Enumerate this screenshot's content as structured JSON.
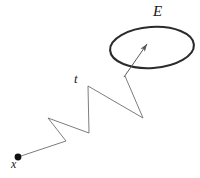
{
  "figure": {
    "background_color": "#ffffff",
    "width": 200,
    "height": 178,
    "labels": {
      "region": "E",
      "time": "t",
      "start_point": "x"
    },
    "colors": {
      "path_stroke": "#6e6e6e",
      "ellipse_stroke": "#2b2b2b",
      "arrow_stroke": "#5a5a5a",
      "dot_fill": "#111111",
      "label_text": "#1a1a1a"
    },
    "elements": {
      "start_dot": {
        "name": "start-point-dot",
        "cx": 18,
        "cy": 157,
        "r": 3.4
      },
      "region_ellipse": {
        "name": "region-ellipse",
        "cx": 152,
        "cy": 47.5,
        "rx": 42,
        "ry": 20.5,
        "rotation_deg": -4,
        "stroke_width": 2.1
      },
      "arrow": {
        "name": "arrow-into-region",
        "from_x": 124,
        "from_y": 77,
        "to_x": 147,
        "to_y": 44,
        "head_length": 8,
        "head_width": 4.2,
        "stroke_width": 1
      },
      "zigzag_path": {
        "name": "random-walk-polyline",
        "stroke_width": 0.9,
        "points": [
          [
            18,
            157
          ],
          [
            66,
            141
          ],
          [
            48,
            118
          ],
          [
            89,
            133
          ],
          [
            88,
            86
          ],
          [
            143,
            118
          ],
          [
            125,
            76
          ]
        ]
      }
    }
  }
}
